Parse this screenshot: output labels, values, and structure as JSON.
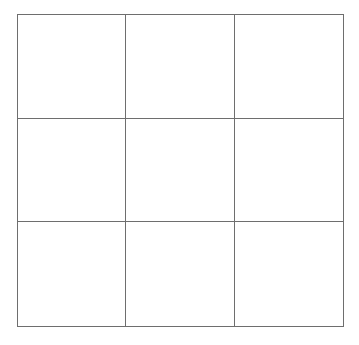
{
  "board": {
    "rows": 3,
    "cols": 3,
    "cells": [
      [
        "",
        "",
        ""
      ],
      [
        "",
        "",
        ""
      ],
      [
        "",
        "",
        ""
      ]
    ],
    "line_color": "#6e6e6e",
    "background_color": "#ffffff"
  }
}
